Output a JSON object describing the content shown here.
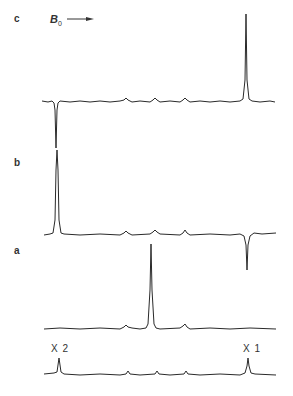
{
  "figure": {
    "field_label": "B",
    "field_subscript": "0",
    "panels": [
      {
        "id": "c",
        "label": "c"
      },
      {
        "id": "b",
        "label": "b"
      },
      {
        "id": "a",
        "label": "a"
      }
    ],
    "reference_labels": {
      "left": "X 2",
      "right": "X 1"
    },
    "caption_partial": ""
  },
  "colors": {
    "trace": "#2a2a2a",
    "background": "#ffffff"
  }
}
